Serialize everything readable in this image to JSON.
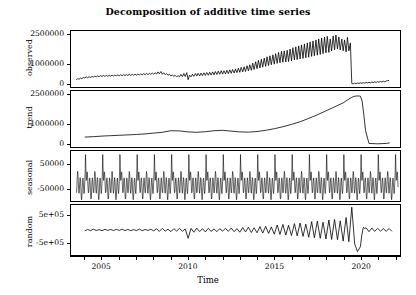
{
  "chart_data": {
    "type": "line",
    "title": "Decomposition of additive time series",
    "xlabel": "Time",
    "ylabel": "",
    "grid": false,
    "legend": false,
    "xlim": [
      2003.2,
      2022.3
    ],
    "xticks": [
      2005,
      2010,
      2015,
      2020
    ],
    "xticklabels": [
      "2005",
      "2010",
      "2015",
      "2020"
    ],
    "xminor_step": 1,
    "panels": [
      {
        "name": "observed",
        "label": "observed",
        "ylim": [
          -120000,
          2700000
        ],
        "yticks": [
          0,
          1000000,
          2500000
        ],
        "yticklabels": [
          "0",
          "1000000",
          "2500000"
        ],
        "x": [
          2003.5,
          2003.58,
          2003.67,
          2003.75,
          2003.83,
          2003.92,
          2004,
          2004.08,
          2004.17,
          2004.25,
          2004.33,
          2004.42,
          2004.5,
          2004.58,
          2004.67,
          2004.75,
          2004.83,
          2004.92,
          2005,
          2005.08,
          2005.17,
          2005.25,
          2005.33,
          2005.42,
          2005.5,
          2005.58,
          2005.67,
          2005.75,
          2005.83,
          2005.92,
          2006,
          2006.08,
          2006.17,
          2006.25,
          2006.33,
          2006.42,
          2006.5,
          2006.58,
          2006.67,
          2006.75,
          2006.83,
          2006.92,
          2007,
          2007.08,
          2007.17,
          2007.25,
          2007.33,
          2007.42,
          2007.5,
          2007.58,
          2007.67,
          2007.75,
          2007.83,
          2007.92,
          2008,
          2008.08,
          2008.17,
          2008.25,
          2008.33,
          2008.42,
          2008.5,
          2008.58,
          2008.67,
          2008.75,
          2008.83,
          2008.92,
          2009,
          2009.08,
          2009.17,
          2009.25,
          2009.33,
          2009.42,
          2009.5,
          2009.58,
          2009.67,
          2009.75,
          2009.83,
          2009.92,
          2010,
          2010.08,
          2010.17,
          2010.25,
          2010.33,
          2010.42,
          2010.5,
          2010.58,
          2010.67,
          2010.75,
          2010.83,
          2010.92,
          2011,
          2011.08,
          2011.17,
          2011.25,
          2011.33,
          2011.42,
          2011.5,
          2011.58,
          2011.67,
          2011.75,
          2011.83,
          2011.92,
          2012,
          2012.08,
          2012.17,
          2012.25,
          2012.33,
          2012.42,
          2012.5,
          2012.58,
          2012.67,
          2012.75,
          2012.83,
          2012.92,
          2013,
          2013.08,
          2013.17,
          2013.25,
          2013.33,
          2013.42,
          2013.5,
          2013.58,
          2013.67,
          2013.75,
          2013.83,
          2013.92,
          2014,
          2014.08,
          2014.17,
          2014.25,
          2014.33,
          2014.42,
          2014.5,
          2014.58,
          2014.67,
          2014.75,
          2014.83,
          2014.92,
          2015,
          2015.08,
          2015.17,
          2015.25,
          2015.33,
          2015.42,
          2015.5,
          2015.58,
          2015.67,
          2015.75,
          2015.83,
          2015.92,
          2016,
          2016.08,
          2016.17,
          2016.25,
          2016.33,
          2016.42,
          2016.5,
          2016.58,
          2016.67,
          2016.75,
          2016.83,
          2016.92,
          2017,
          2017.08,
          2017.17,
          2017.25,
          2017.33,
          2017.42,
          2017.5,
          2017.58,
          2017.67,
          2017.75,
          2017.83,
          2017.92,
          2018,
          2018.08,
          2018.17,
          2018.25,
          2018.33,
          2018.42,
          2018.5,
          2018.58,
          2018.67,
          2018.75,
          2018.83,
          2018.92,
          2019,
          2019.08,
          2019.17,
          2019.25,
          2019.33,
          2019.42,
          2019.5,
          2019.58,
          2019.67,
          2019.75,
          2019.83,
          2019.92,
          2020,
          2020.08,
          2020.17,
          2020.25,
          2020.33,
          2020.42,
          2020.5,
          2020.58,
          2020.67,
          2020.75,
          2020.83,
          2020.92,
          2021,
          2021.08,
          2021.17,
          2021.25,
          2021.33,
          2021.42,
          2021.5,
          2021.58,
          2021.67,
          2021.75,
          2021.83,
          2021.92,
          2022,
          2022.08,
          2022.17
        ],
        "y": [
          230000,
          300000,
          275000,
          330000,
          300000,
          360000,
          330000,
          390000,
          345000,
          400000,
          360000,
          410000,
          380000,
          430000,
          395000,
          440000,
          400000,
          450000,
          410000,
          460000,
          415000,
          465000,
          420000,
          470000,
          425000,
          480000,
          430000,
          485000,
          440000,
          490000,
          445000,
          495000,
          450000,
          500000,
          455000,
          505000,
          460000,
          515000,
          465000,
          520000,
          470000,
          525000,
          480000,
          535000,
          485000,
          545000,
          490000,
          550000,
          500000,
          560000,
          505000,
          570000,
          515000,
          580000,
          520000,
          600000,
          530000,
          640000,
          545000,
          660000,
          520000,
          600000,
          500000,
          560000,
          470000,
          520000,
          440000,
          480000,
          420000,
          460000,
          400000,
          450000,
          390000,
          520000,
          400000,
          560000,
          410000,
          600000,
          250000,
          480000,
          390000,
          520000,
          420000,
          560000,
          430000,
          570000,
          440000,
          580000,
          450000,
          595000,
          460000,
          610000,
          470000,
          620000,
          480000,
          640000,
          495000,
          660000,
          510000,
          680000,
          520000,
          700000,
          530000,
          700000,
          540000,
          720000,
          555000,
          740000,
          570000,
          760000,
          585000,
          790000,
          600000,
          830000,
          620000,
          870000,
          640000,
          900000,
          660000,
          950000,
          690000,
          1000000,
          720000,
          1080000,
          760000,
          1150000,
          800000,
          1220000,
          840000,
          1280000,
          880000,
          1340000,
          920000,
          1400000,
          960000,
          1450000,
          1000000,
          1500000,
          1030000,
          1560000,
          1070000,
          1620000,
          1100000,
          1680000,
          1130000,
          1700000,
          1140000,
          1730000,
          1160000,
          1790000,
          1200000,
          1860000,
          1240000,
          1900000,
          1260000,
          1950000,
          1290000,
          2000000,
          1320000,
          2050000,
          1350000,
          2100000,
          1380000,
          2150000,
          1420000,
          2200000,
          1450000,
          2250000,
          1480000,
          2300000,
          1520000,
          2350000,
          1560000,
          2400000,
          1600000,
          2430000,
          1620000,
          2300000,
          1700000,
          2450000,
          1750000,
          2500000,
          1800000,
          2400000,
          1750000,
          2300000,
          1700000,
          2250000,
          1650000,
          2380000,
          1700000,
          2100000,
          60000,
          40000,
          70000,
          55000,
          80000,
          60000,
          90000,
          70000,
          100000,
          75000,
          110000,
          80000,
          120000,
          90000,
          130000,
          100000,
          140000,
          110000,
          150000,
          120000,
          160000,
          130000,
          170000,
          140000,
          185000,
          200000,
          215000
        ]
      },
      {
        "name": "trend",
        "label": "trend",
        "ylim": [
          -120000,
          2700000
        ],
        "yticks": [
          0,
          1000000,
          2500000
        ],
        "yticklabels": [
          "0",
          "1000000",
          "2500000"
        ],
        "x": [
          2004,
          2004.5,
          2005,
          2005.5,
          2006,
          2006.5,
          2007,
          2007.5,
          2008,
          2008.5,
          2009,
          2009.5,
          2010,
          2010.5,
          2011,
          2011.5,
          2012,
          2012.5,
          2013,
          2013.5,
          2014,
          2014.5,
          2015,
          2015.5,
          2016,
          2016.5,
          2017,
          2017.5,
          2018,
          2018.5,
          2019,
          2019.25,
          2019.5,
          2019.6,
          2019.7,
          2019.8,
          2019.9,
          2020,
          2020.1,
          2020.2,
          2020.3,
          2020.5,
          2021,
          2021.5,
          2021.7
        ],
        "y": [
          380000,
          400000,
          430000,
          450000,
          470000,
          490000,
          510000,
          540000,
          580000,
          620000,
          700000,
          690000,
          640000,
          620000,
          650000,
          700000,
          720000,
          680000,
          640000,
          630000,
          660000,
          720000,
          800000,
          900000,
          1020000,
          1150000,
          1320000,
          1500000,
          1700000,
          1900000,
          2100000,
          2250000,
          2380000,
          2420000,
          2440000,
          2450000,
          2450000,
          2440000,
          2200000,
          1500000,
          700000,
          60000,
          40000,
          60000,
          90000
        ]
      },
      {
        "name": "seasonal",
        "label": "seasonal",
        "ylim": [
          -95000,
          105000
        ],
        "yticks": [
          -50000,
          50000
        ],
        "yticklabels": [
          "-50000",
          "50000"
        ],
        "amplitude_peak": 95000,
        "amplitude_trough": -60000,
        "period_years": 1,
        "cycles": 19
      },
      {
        "name": "random",
        "label": "random",
        "ylim": [
          -900000,
          900000
        ],
        "yticks": [
          -500000,
          500000
        ],
        "yticklabels": [
          "-5e+05",
          "5e+05"
        ],
        "x": [
          2004,
          2004.17,
          2004.33,
          2004.5,
          2004.67,
          2004.83,
          2005,
          2005.17,
          2005.33,
          2005.5,
          2005.67,
          2005.83,
          2006,
          2006.17,
          2006.33,
          2006.5,
          2006.67,
          2006.83,
          2007,
          2007.17,
          2007.33,
          2007.5,
          2007.67,
          2007.83,
          2008,
          2008.17,
          2008.33,
          2008.5,
          2008.67,
          2008.83,
          2009,
          2009.17,
          2009.33,
          2009.5,
          2009.67,
          2009.83,
          2010,
          2010.17,
          2010.33,
          2010.5,
          2010.67,
          2010.83,
          2011,
          2011.17,
          2011.33,
          2011.5,
          2011.67,
          2011.83,
          2012,
          2012.17,
          2012.33,
          2012.5,
          2012.67,
          2012.83,
          2013,
          2013.17,
          2013.33,
          2013.5,
          2013.67,
          2013.83,
          2014,
          2014.17,
          2014.33,
          2014.5,
          2014.67,
          2014.83,
          2015,
          2015.17,
          2015.33,
          2015.5,
          2015.67,
          2015.83,
          2016,
          2016.17,
          2016.33,
          2016.5,
          2016.67,
          2016.83,
          2017,
          2017.17,
          2017.33,
          2017.5,
          2017.67,
          2017.83,
          2018,
          2018.17,
          2018.33,
          2018.5,
          2018.67,
          2018.83,
          2019,
          2019.17,
          2019.33,
          2019.5,
          2019.67,
          2019.83,
          2020,
          2020.08,
          2020.17,
          2020.25,
          2020.33,
          2020.5,
          2020.67,
          2020.83,
          2021,
          2021.17,
          2021.33,
          2021.5,
          2021.67,
          2021.83
        ],
        "y": [
          -30000,
          20000,
          -25000,
          30000,
          -20000,
          15000,
          -25000,
          25000,
          -15000,
          20000,
          -20000,
          25000,
          -15000,
          30000,
          -20000,
          20000,
          -25000,
          15000,
          -20000,
          30000,
          -25000,
          20000,
          -15000,
          25000,
          -30000,
          40000,
          -50000,
          60000,
          -40000,
          30000,
          -60000,
          50000,
          -40000,
          60000,
          -50000,
          40000,
          -300000,
          60000,
          -80000,
          70000,
          -60000,
          50000,
          -70000,
          60000,
          -50000,
          40000,
          -60000,
          50000,
          -40000,
          60000,
          -50000,
          70000,
          -60000,
          50000,
          -80000,
          90000,
          -70000,
          100000,
          -90000,
          80000,
          -100000,
          120000,
          -110000,
          130000,
          -120000,
          110000,
          -150000,
          180000,
          -160000,
          200000,
          -180000,
          170000,
          -200000,
          230000,
          -210000,
          250000,
          -230000,
          210000,
          -260000,
          300000,
          -280000,
          320000,
          -300000,
          280000,
          -320000,
          360000,
          -340000,
          380000,
          -350000,
          330000,
          -400000,
          450000,
          -420000,
          820000,
          -500000,
          -780000,
          -600000,
          -200000,
          100000,
          50000,
          80000,
          -60000,
          70000,
          -50000,
          60000,
          -40000,
          50000,
          -45000,
          55000,
          -50000
        ]
      }
    ]
  }
}
